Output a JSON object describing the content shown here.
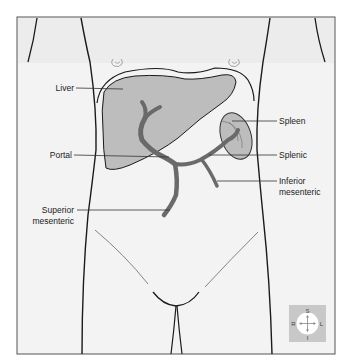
{
  "figure": {
    "labels": {
      "liver": "Liver",
      "portal": "Portal",
      "superior_mesenteric_line1": "Superior",
      "superior_mesenteric_line2": "mesenteric",
      "spleen": "Spleen",
      "splenic": "Splenic",
      "inferior_mesenteric_line1": "Inferior",
      "inferior_mesenteric_line2": "mesenteric"
    },
    "compass": {
      "superior": "S",
      "inferior": "I",
      "right": "R",
      "left": "L"
    },
    "colors": {
      "vessel": "#6a6a6a",
      "organ_fill": "#bdbdbd",
      "outline": "#1a1a1a",
      "background": "#f2f2f2",
      "compass_bg": "#c8c8c8"
    }
  }
}
